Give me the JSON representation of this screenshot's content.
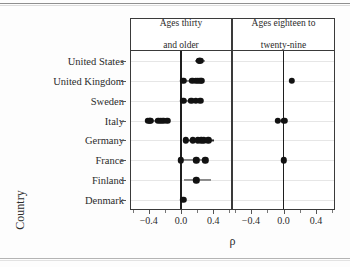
{
  "chart_data": {
    "type": "scatter",
    "subtype": "faceted-dot-plot",
    "title": "",
    "xlabel": "ρ",
    "ylabel": "Country",
    "xlim": [
      -0.62,
      0.62
    ],
    "xticks": [
      -0.4,
      0.0,
      0.4
    ],
    "xticklabels": [
      "−0.4",
      "0.0",
      "0.4"
    ],
    "xminorticks": [
      -0.6,
      -0.2,
      0.2,
      0.6
    ],
    "grid": "horizontal",
    "zero_reference_line": 0.0,
    "categories": [
      "United States",
      "United Kingdom",
      "Sweden",
      "Italy",
      "Germany",
      "France",
      "Finland",
      "Denmark"
    ],
    "panels": [
      {
        "label": "Ages thirty and older",
        "label_line1": "Ages thirty",
        "label_line2": "and older",
        "series": [
          {
            "category": "United States",
            "values": [
              0.22,
              0.23,
              0.24
            ],
            "range": [
              0.17,
              0.3
            ]
          },
          {
            "category": "United Kingdom",
            "values": [
              0.03,
              0.14,
              0.18,
              0.21,
              0.24,
              0.26
            ],
            "range": [
              0.03,
              0.27
            ]
          },
          {
            "category": "Sweden",
            "values": [
              0.03,
              0.13,
              0.18,
              0.24
            ],
            "range": [
              0.03,
              0.25
            ]
          },
          {
            "category": "Italy",
            "values": [
              -0.41,
              -0.39,
              -0.38,
              -0.28,
              -0.25,
              -0.22,
              -0.17
            ],
            "range": [
              -0.42,
              -0.16
            ]
          },
          {
            "category": "Germany",
            "values": [
              0.06,
              0.15,
              0.21,
              0.25,
              0.28,
              0.34
            ],
            "range": [
              0.05,
              0.41
            ]
          },
          {
            "category": "France",
            "values": [
              0.0,
              0.19,
              0.3
            ],
            "range": [
              0.0,
              0.31
            ]
          },
          {
            "category": "Finland",
            "values": [
              0.19
            ],
            "range": [
              0.04,
              0.37
            ]
          },
          {
            "category": "Denmark",
            "values": [
              0.03
            ],
            "range": [
              0.02,
              0.05
            ]
          }
        ]
      },
      {
        "label": "Ages eighteen to twenty-nine",
        "label_line1": "Ages eighteen to",
        "label_line2": "twenty-nine",
        "series": [
          {
            "category": "United States",
            "values": [],
            "range": null
          },
          {
            "category": "United Kingdom",
            "values": [
              0.1
            ],
            "range": [
              0.1,
              0.1
            ]
          },
          {
            "category": "Sweden",
            "values": [],
            "range": null
          },
          {
            "category": "Italy",
            "values": [
              -0.07,
              0.01
            ],
            "range": [
              -0.09,
              0.02
            ]
          },
          {
            "category": "Germany",
            "values": [],
            "range": null
          },
          {
            "category": "France",
            "values": [
              0.0
            ],
            "range": [
              0.0,
              0.0
            ]
          },
          {
            "category": "Finland",
            "values": [],
            "range": null
          },
          {
            "category": "Denmark",
            "values": [],
            "range": null
          }
        ]
      }
    ],
    "colors": {
      "dot": "#121212",
      "segment": "#2a2a2a",
      "zero_line": "#1e1e1e",
      "grid": "#e6e6e6",
      "panel_border": "#3a3a3a",
      "background": "#ffffff",
      "text": "#2b2b2b"
    }
  }
}
